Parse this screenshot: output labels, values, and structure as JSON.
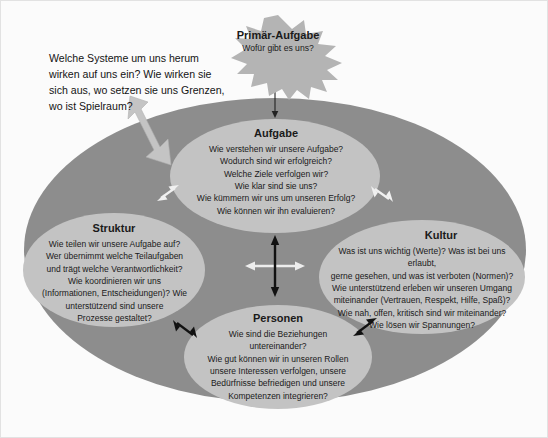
{
  "diagram": {
    "intro": {
      "text": "Welche Systeme um uns herum wirken auf uns ein? Wie wirken sie sich aus, wo setzen sie uns Grenzen, wo ist Spielraum?"
    },
    "star": {
      "title": "Primär-Aufgabe",
      "subtitle": "Wofür gibt es uns?"
    },
    "nodes": {
      "aufgabe": {
        "title": "Aufgabe",
        "body": "Wie verstehen wir unsere Aufgabe?\nWodurch sind wir erfolgreich?\nWelche Ziele verfolgen wir?\nWie klar sind sie uns?\nWie kümmern wir uns um unseren Erfolg?\nWie können wir ihn evaluieren?"
      },
      "struktur": {
        "title": "Struktur",
        "body": "Wie teilen wir unsere Aufgabe auf?\nWer übernimmt welche Teilaufgaben\nund trägt welche Verantwortlichkeit?\nWie koordinieren wir uns\n(Informationen, Entscheidungen)? Wie\nunterstützend sind unsere\nProzesse gestaltet?"
      },
      "kultur": {
        "title": "Kultur",
        "body": "Was ist uns wichtig (Werte)? Was ist bei uns erlaubt,\ngerne gesehen, und was ist verboten (Normen)?\nWie unterstützend erleben wir unseren Umgang\nmiteinander (Vertrauen, Respekt, Hilfe, Spaß)?\nWie nah, offen, kritisch sind wir miteinander?\nWie lösen wir Spannungen?"
      },
      "personen": {
        "title": "Personen",
        "body": "Wie sind die Beziehungen\nuntereinander?\nWie gut können wir in unseren Rollen\nunsere Interessen verfolgen, unsere\nBedürfnisse befriedigen und unsere\nKompetenzen integrieren?"
      }
    },
    "colors": {
      "background": "#fbfbfb",
      "outer_ellipse": "#8d8d8d",
      "node_ellipse": "#c3c3c3",
      "star_fill": "#b4b4b4",
      "arrow_gray": "#c0c0c0",
      "arrow_black": "#111111",
      "arrow_white": "#eeeeee",
      "text": "#1a1a1a"
    }
  }
}
